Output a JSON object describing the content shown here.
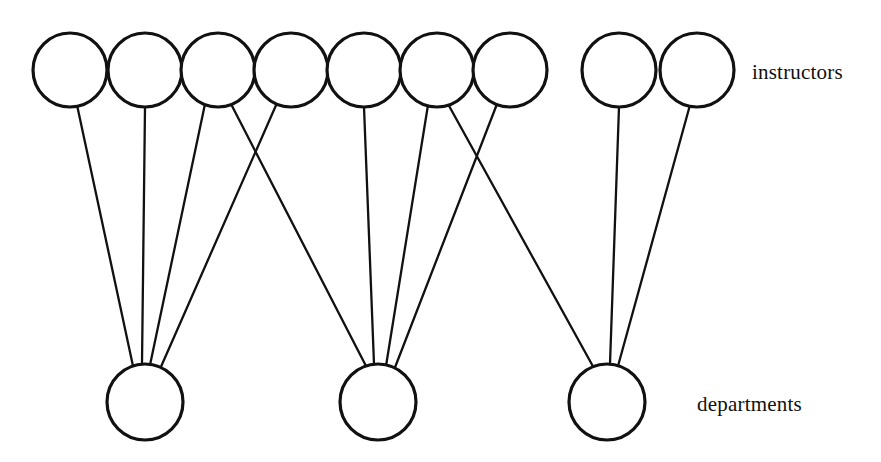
{
  "figure": {
    "kind": "bipartite-graph",
    "background_color": "#ffffff",
    "stroke_color": "#111111",
    "width": 881,
    "height": 462
  },
  "labels": {
    "top_row": "instructors",
    "bottom_row": "departments"
  },
  "chart_data": {
    "type": "diagram",
    "title": "",
    "node_sets": [
      {
        "name": "instructors",
        "label": "instructors",
        "count": 9,
        "radius": 37,
        "center_y": 70,
        "nodes": [
          {
            "id": "i1",
            "cx": 70,
            "cy": 70
          },
          {
            "id": "i2",
            "cx": 145,
            "cy": 70
          },
          {
            "id": "i3",
            "cx": 218,
            "cy": 70
          },
          {
            "id": "i4",
            "cx": 291,
            "cy": 70
          },
          {
            "id": "i5",
            "cx": 364,
            "cy": 70
          },
          {
            "id": "i6",
            "cx": 437,
            "cy": 70
          },
          {
            "id": "i7",
            "cx": 510,
            "cy": 70
          },
          {
            "id": "i8",
            "cx": 619,
            "cy": 70
          },
          {
            "id": "i9",
            "cx": 697,
            "cy": 70
          }
        ]
      },
      {
        "name": "departments",
        "label": "departments",
        "count": 3,
        "radius": 38,
        "center_y": 402,
        "nodes": [
          {
            "id": "d1",
            "cx": 145,
            "cy": 402
          },
          {
            "id": "d2",
            "cx": 378,
            "cy": 402
          },
          {
            "id": "d3",
            "cx": 607,
            "cy": 402
          }
        ]
      }
    ],
    "edges": [
      {
        "from": "i1",
        "to": "d1",
        "x1": 77,
        "y1": 105,
        "x2": 133,
        "y2": 366
      },
      {
        "from": "i2",
        "to": "d1",
        "x1": 145,
        "y1": 107,
        "x2": 142,
        "y2": 364
      },
      {
        "from": "i3",
        "to": "d1",
        "x1": 205,
        "y1": 104,
        "x2": 150,
        "y2": 365
      },
      {
        "from": "i3",
        "to": "d2",
        "x1": 231,
        "y1": 104,
        "x2": 366,
        "y2": 366
      },
      {
        "from": "i4",
        "to": "d1",
        "x1": 277,
        "y1": 103,
        "x2": 160,
        "y2": 369
      },
      {
        "from": "i5",
        "to": "d2",
        "x1": 364,
        "y1": 107,
        "x2": 374,
        "y2": 364
      },
      {
        "from": "i6",
        "to": "d2",
        "x1": 428,
        "y1": 105,
        "x2": 386,
        "y2": 366
      },
      {
        "from": "i7",
        "to": "d2",
        "x1": 497,
        "y1": 104,
        "x2": 394,
        "y2": 370
      },
      {
        "from": "i6",
        "to": "d3",
        "x1": 448,
        "y1": 104,
        "x2": 595,
        "y2": 370
      },
      {
        "from": "i8",
        "to": "d3",
        "x1": 619,
        "y1": 107,
        "x2": 610,
        "y2": 364
      },
      {
        "from": "i9",
        "to": "d3",
        "x1": 690,
        "y1": 105,
        "x2": 618,
        "y2": 366
      }
    ],
    "edge_counts": {
      "department_1": 4,
      "department_2": 4,
      "department_3": 3,
      "total": 11
    }
  }
}
